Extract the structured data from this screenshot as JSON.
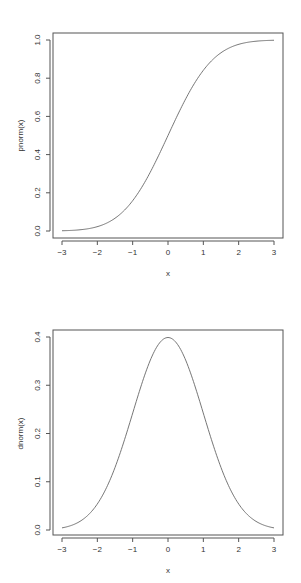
{
  "chart_data": [
    {
      "type": "line",
      "title": "",
      "xlabel": "x",
      "ylabel": "pnorm(x)",
      "xlim": [
        -3,
        3
      ],
      "ylim": [
        0,
        1
      ],
      "x_ticks": [
        "-3",
        "-2",
        "-1",
        "0",
        "1",
        "2",
        "3"
      ],
      "y_ticks": [
        "0.0",
        "0.2",
        "0.4",
        "0.6",
        "0.8",
        "1.0"
      ],
      "grid": false,
      "series": [
        {
          "name": "pnorm(x)",
          "x": [
            -3,
            -2.5,
            -2,
            -1.5,
            -1,
            -0.5,
            0,
            0.5,
            1,
            1.5,
            2,
            2.5,
            3
          ],
          "values": [
            0.001,
            0.006,
            0.023,
            0.067,
            0.159,
            0.309,
            0.5,
            0.691,
            0.841,
            0.933,
            0.977,
            0.994,
            0.999
          ]
        }
      ]
    },
    {
      "type": "line",
      "title": "",
      "xlabel": "x",
      "ylabel": "dnorm(x)",
      "xlim": [
        -3,
        3
      ],
      "ylim": [
        0,
        0.4
      ],
      "x_ticks": [
        "-3",
        "-2",
        "-1",
        "0",
        "1",
        "2",
        "3"
      ],
      "y_ticks": [
        "0.0",
        "0.1",
        "0.2",
        "0.3",
        "0.4"
      ],
      "grid": false,
      "series": [
        {
          "name": "dnorm(x)",
          "x": [
            -3,
            -2.5,
            -2,
            -1.5,
            -1,
            -0.5,
            0,
            0.5,
            1,
            1.5,
            2,
            2.5,
            3
          ],
          "values": [
            0.004,
            0.018,
            0.054,
            0.13,
            0.242,
            0.352,
            0.399,
            0.352,
            0.242,
            0.13,
            0.054,
            0.018,
            0.004
          ]
        }
      ]
    }
  ],
  "plots": [
    {
      "xlabel": "x",
      "ylabel": "pnorm(x)"
    },
    {
      "xlabel": "x",
      "ylabel": "dnorm(x)"
    }
  ]
}
